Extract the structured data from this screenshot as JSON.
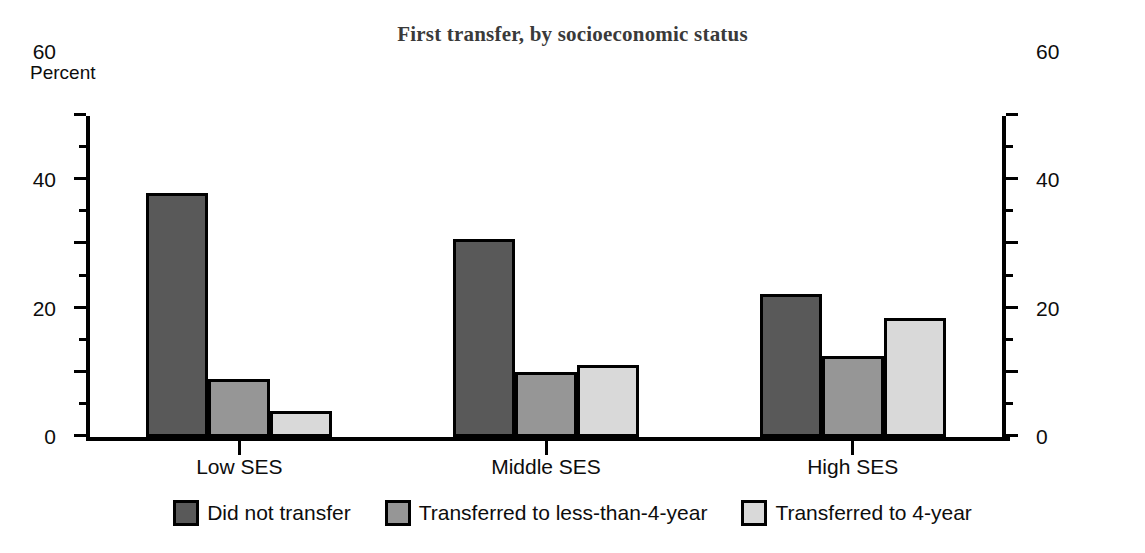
{
  "chart_data": {
    "type": "bar",
    "title": "First transfer, by socioeconomic status",
    "xlabel": "",
    "ylabel": "Percent",
    "ylim": [
      0,
      100
    ],
    "ytick_step": 20,
    "yminor_step": 10,
    "grid": false,
    "dual_axis": true,
    "legend_position": "bottom",
    "categories": [
      "Low SES",
      "Middle SES",
      "High SES"
    ],
    "ytick_labels": [
      "0",
      "20",
      "40",
      "60",
      "80",
      "100"
    ],
    "ytick_labels_right": [
      "0",
      "20",
      "40",
      "60",
      "80",
      "100"
    ],
    "series": [
      {
        "name": "Did not transfer",
        "color": "#595959",
        "values": [
          76.0,
          61.8,
          44.6
        ]
      },
      {
        "name": "Transferred to less-than-4-year",
        "color": "#969696",
        "values": [
          18.0,
          20.3,
          25.2
        ]
      },
      {
        "name": "Transferred to 4-year",
        "color": "#d9d9d9",
        "values": [
          8.0,
          22.5,
          37.0
        ]
      }
    ]
  },
  "colors": {
    "axis": "#000000",
    "title": "#3a3a3a",
    "text": "#0d0d0d",
    "background": "#ffffff",
    "series_dark": "#595959",
    "series_medium": "#969696",
    "series_light": "#d9d9d9"
  }
}
